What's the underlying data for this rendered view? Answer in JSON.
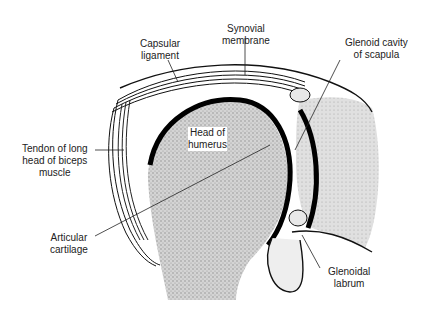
{
  "labels": {
    "capsular_ligament": "Capsular\nligament",
    "synovial_membrane": "Synovial\nmembrane",
    "glenoid_cavity": "Glenoid cavity\nof scapula",
    "tendon_biceps": "Tendon of long\nhead of biceps\nmuscle",
    "head_humerus": "Head of\nhumerus",
    "articular_cartilage": "Articular\ncartilage",
    "glenoidal_labrum": "Glenoidal\nlabrum"
  },
  "colors": {
    "ink": "#111111",
    "stipple": "#b9b9b9",
    "background": "#ffffff"
  }
}
